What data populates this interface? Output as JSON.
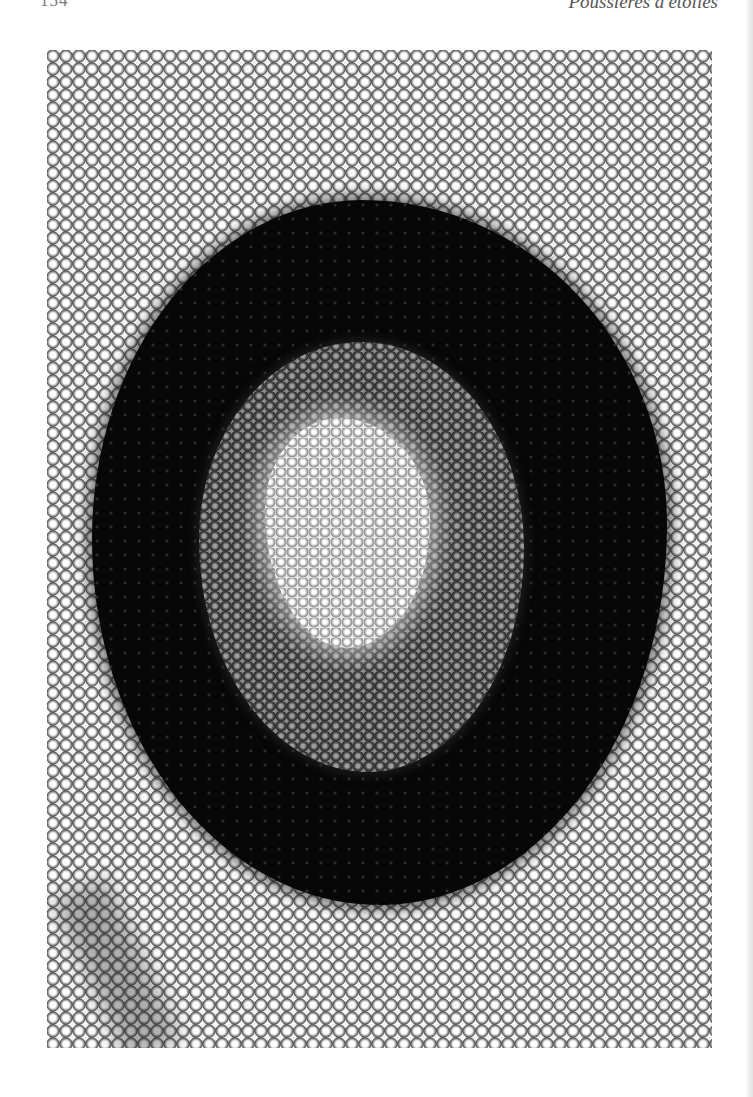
{
  "page": {
    "page_number": "154",
    "running_title": "Poussières d'étoiles"
  },
  "figure": {
    "regions": [
      {
        "name": "outer-scale-field",
        "tone": "#d0d0d0"
      },
      {
        "name": "dark-ring",
        "tone": "#080808"
      },
      {
        "name": "gray-ring",
        "tone": "#5a5a5a"
      },
      {
        "name": "bright-center",
        "tone": "#f0f0f0"
      }
    ]
  }
}
